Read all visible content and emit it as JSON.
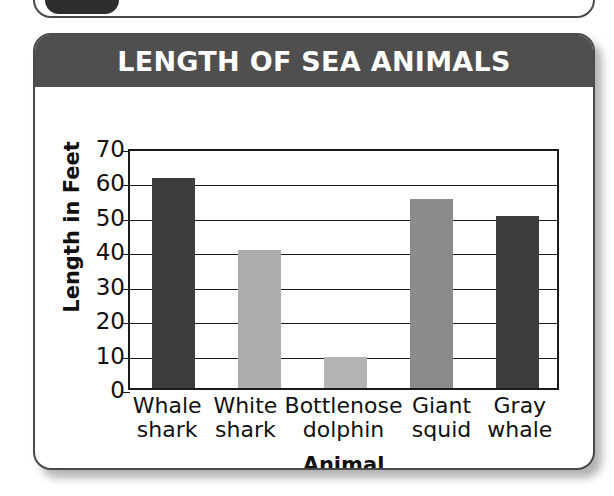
{
  "clipped_top": {
    "badge_number": "6"
  },
  "card": {
    "title": "LENGTH OF SEA ANIMALS",
    "title_bg": "#4f4f4f",
    "title_color": "#ffffff",
    "border_color": "#4a4a4a"
  },
  "chart_data": {
    "type": "bar",
    "title": "LENGTH OF SEA ANIMALS",
    "xlabel": "Animal",
    "ylabel": "Length in Feet",
    "categories": [
      "Whale shark",
      "White shark",
      "Bottlenose dolphin",
      "Giant squid",
      "Gray whale"
    ],
    "category_lines": [
      [
        "Whale",
        "shark"
      ],
      [
        "White",
        "shark"
      ],
      [
        "Bottlenose",
        "dolphin"
      ],
      [
        "Giant",
        "squid"
      ],
      [
        "Gray",
        "whale"
      ]
    ],
    "values": [
      61,
      40,
      9,
      55,
      50
    ],
    "bar_colors": [
      "#3c3c3c",
      "#adadad",
      "#b4b4b4",
      "#8b8b8b",
      "#3c3c3c"
    ],
    "ylim": [
      0,
      70
    ],
    "yticks": [
      0,
      10,
      20,
      30,
      40,
      50,
      60,
      70
    ],
    "ytick_labels": [
      "0",
      "10",
      "20",
      "30",
      "40",
      "50",
      "60",
      "70"
    ],
    "grid": true,
    "grid_axis": "y",
    "legend": false,
    "axis_color": "#1a1a1a",
    "plot_background": "#ffffff"
  }
}
